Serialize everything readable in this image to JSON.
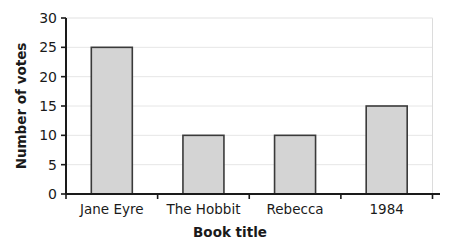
{
  "chart_data": {
    "type": "bar",
    "title": "",
    "subtitle": "",
    "xlabel": "Book title",
    "ylabel": "Number of votes",
    "categories": [
      "Jane Eyre",
      "The Hobbit",
      "Rebecca",
      "1984"
    ],
    "values": [
      25,
      10,
      10,
      15
    ],
    "series": [
      {
        "name": "Number of votes",
        "values": [
          25,
          10,
          10,
          15
        ]
      }
    ],
    "ylim": [
      0,
      30
    ],
    "y_ticks": [
      0,
      5,
      10,
      15,
      20,
      25,
      30
    ],
    "y_tick_labels": [
      "0",
      "5",
      "10",
      "15",
      "20",
      "25",
      "30"
    ],
    "grid": "horizontal",
    "legend": "none",
    "annotations": [],
    "colors": {
      "bar_fill": "#d4d4d4",
      "bar_stroke": "#3a3a3a",
      "grid": "#e6e6e6",
      "axis": "#1a1a1a",
      "text": "#1a1a1a",
      "background": "#ffffff",
      "plot_border": "#d9d9d9"
    }
  }
}
